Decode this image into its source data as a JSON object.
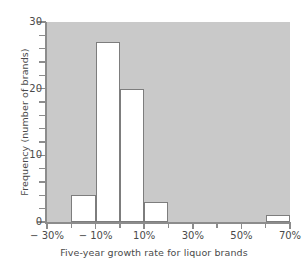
{
  "chart_data": {
    "type": "bar",
    "title": "",
    "subtitle": "",
    "xlabel": "Five-year growth rate for liquor brands",
    "ylabel": "Frequency (number of brands)",
    "xlim": [
      -30,
      70
    ],
    "ylim": [
      0,
      30
    ],
    "grid": false,
    "legend": null,
    "bin_width": 10,
    "x_unit": "%",
    "categories": [
      "-30% to -20%",
      "-20% to -10%",
      "-10% to 0%",
      "0% to 10%",
      "10% to 20%",
      "20% to 30%",
      "30% to 40%",
      "40% to 50%",
      "50% to 60%",
      "60% to 70%"
    ],
    "bin_edges": [
      -30,
      -20,
      -10,
      0,
      10,
      20,
      30,
      40,
      50,
      60,
      70
    ],
    "values": [
      0,
      4,
      27,
      20,
      3,
      0,
      0,
      0,
      0,
      1
    ],
    "bars": [
      {
        "label": "-20% to -10%",
        "x0": -20,
        "x1": -10,
        "value": 4
      },
      {
        "label": "-10% to 0%",
        "x0": -10,
        "x1": 0,
        "value": 27
      },
      {
        "label": "0% to 10%",
        "x0": 0,
        "x1": 10,
        "value": 20
      },
      {
        "label": "10% to 20%",
        "x0": 10,
        "x1": 20,
        "value": 3
      },
      {
        "label": "60% to 70%",
        "x0": 60,
        "x1": 70,
        "value": 1
      }
    ],
    "x_ticks": [
      -30,
      -20,
      -10,
      0,
      10,
      20,
      30,
      40,
      50,
      60,
      70
    ],
    "x_tick_labels": [
      {
        "value": -30,
        "label": "− 30%"
      },
      {
        "value": -10,
        "label": "− 10%"
      },
      {
        "value": 10,
        "label": "10%"
      },
      {
        "value": 30,
        "label": "30%"
      },
      {
        "value": 50,
        "label": "50%"
      },
      {
        "value": 70,
        "label": "70%"
      }
    ],
    "y_ticks_minor": [
      2,
      4,
      6,
      8,
      12,
      14,
      16,
      18,
      22,
      24,
      26,
      28
    ],
    "y_tick_labels": [
      {
        "value": 0,
        "label": "0"
      },
      {
        "value": 10,
        "label": "10"
      },
      {
        "value": 20,
        "label": "20"
      },
      {
        "value": 30,
        "label": "30"
      }
    ],
    "colors": {
      "plot_background": "#c9c9c9",
      "bar_fill": "#ffffff",
      "bar_edge": "#7d7d7d",
      "axis": "#8c8c8c",
      "text": "#4a4a4a",
      "figure_background": "#ffffff"
    }
  }
}
